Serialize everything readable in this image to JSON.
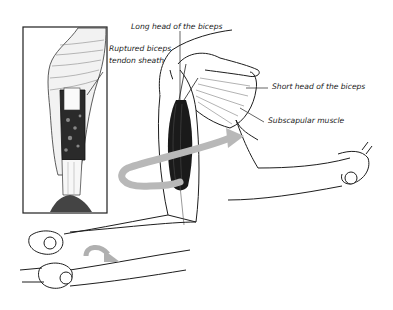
{
  "figure": {
    "colors": {
      "ink": "#1e1e1e",
      "muscle_dark": "#1a1a1a",
      "rotation_arrow": "#b8b8b8",
      "background": "#ffffff"
    },
    "labels": {
      "long_head": "Long head of the biceps",
      "ruptured_sheath_line1": "Ruptured biceps",
      "ruptured_sheath_line2": "tendon sheath",
      "short_head": "Short head of the biceps",
      "subscapular": "Subscapular muscle"
    },
    "inset": {
      "description": "Close-up of ruptured biceps tendon sheath"
    },
    "arrows": [
      {
        "name": "upper-arm-rotation-arrow",
        "type": "curved"
      },
      {
        "name": "forearm-supination-arrow",
        "type": "curved"
      }
    ]
  }
}
